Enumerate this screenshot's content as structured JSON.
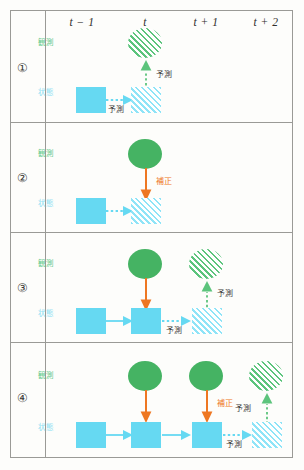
{
  "diagram": {
    "colors": {
      "observation_solid": "#45b363",
      "observation_hatch": "#5cc47c",
      "state_solid": "#66d9f2",
      "state_hatch": "#8fe4f7",
      "correction_arrow": "#ee7722",
      "caption_dark": "#3c3c3a",
      "frame": "#9a9a96",
      "background": "#fdfdfb"
    },
    "columns": [
      {
        "label": "t − 1"
      },
      {
        "label": "t"
      },
      {
        "label": "t + 1"
      },
      {
        "label": "t + 2"
      }
    ],
    "row_labels": {
      "observation": "観測",
      "state": "状態"
    },
    "captions": {
      "prediction": "予測",
      "correction": "補正"
    },
    "rows": [
      {
        "number": "①",
        "obs_label": "観測",
        "state_label": "状態",
        "caption_up": "予測",
        "caption_right": "予測"
      },
      {
        "number": "②",
        "obs_label": "観測",
        "state_label": "状態",
        "caption_correct": "補正"
      },
      {
        "number": "③",
        "obs_label": "観測",
        "state_label": "状態",
        "caption_up": "予測",
        "caption_right": "予測"
      },
      {
        "number": "④",
        "obs_label": "観測",
        "state_label": "状態",
        "caption_correct": "補正",
        "caption_up": "予測",
        "caption_right": "予測"
      }
    ]
  }
}
